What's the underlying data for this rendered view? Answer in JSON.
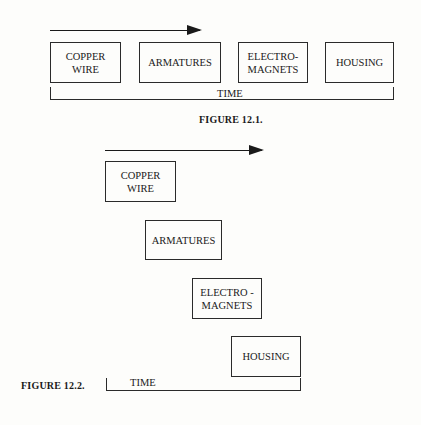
{
  "figure1": {
    "caption": "FIGURE 12.1.",
    "time_label": "TIME",
    "steps": [
      {
        "line1": "COPPER",
        "line2": "WIRE"
      },
      {
        "line1": "ARMATURES",
        "line2": ""
      },
      {
        "line1": "ELECTRO-",
        "line2": "MAGNETS"
      },
      {
        "line1": "HOUSING",
        "line2": ""
      }
    ]
  },
  "figure2": {
    "caption": "FIGURE 12.2.",
    "time_label": "TIME",
    "steps": [
      {
        "line1": "COPPER",
        "line2": "WIRE"
      },
      {
        "line1": "ARMATURES",
        "line2": ""
      },
      {
        "line1": "ELECTRO -",
        "line2": "MAGNETS"
      },
      {
        "line1": "HOUSING",
        "line2": ""
      }
    ]
  }
}
